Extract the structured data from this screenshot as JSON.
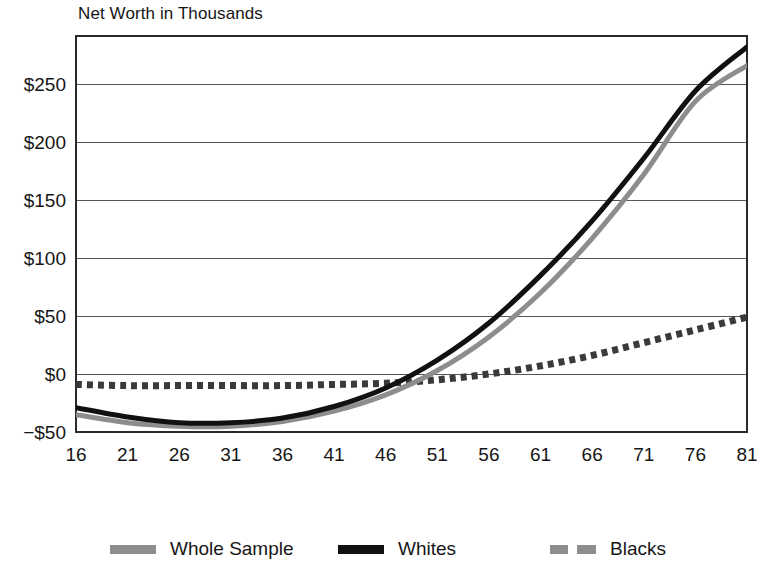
{
  "chart_data": {
    "type": "line",
    "title": "Net Worth in Thousands",
    "xlabel": "",
    "ylabel": "",
    "grid": true,
    "legend_position": "bottom",
    "xlim": [
      16,
      81
    ],
    "ylim": [
      -50,
      290
    ],
    "x_ticks": [
      16,
      21,
      26,
      31,
      36,
      41,
      46,
      51,
      56,
      61,
      66,
      71,
      76,
      81
    ],
    "x_tick_labels": [
      "16",
      "21",
      "26",
      "31",
      "36",
      "41",
      "46",
      "51",
      "56",
      "61",
      "66",
      "71",
      "76",
      "81"
    ],
    "y_ticks": [
      -50,
      0,
      50,
      100,
      150,
      200,
      250
    ],
    "y_tick_labels": [
      "−$50",
      "$0",
      "$50",
      "$100",
      "$150",
      "$200",
      "$250"
    ],
    "x": [
      16,
      21,
      26,
      31,
      36,
      41,
      46,
      51,
      56,
      61,
      66,
      71,
      76,
      81
    ],
    "series": [
      {
        "name": "Whole Sample",
        "style": "solid",
        "color": "#8d8d8d",
        "width": 5,
        "values": [
          -35,
          -42,
          -45,
          -45,
          -41,
          -32,
          -18,
          3,
          32,
          70,
          117,
          172,
          235,
          266
        ]
      },
      {
        "name": "Whites",
        "style": "solid",
        "color": "#111111",
        "width": 5,
        "values": [
          -29,
          -37,
          -42,
          -42,
          -38,
          -28,
          -12,
          12,
          44,
          85,
          132,
          186,
          244,
          282
        ]
      },
      {
        "name": "Blacks",
        "style": "dotted",
        "color": "#3a3a3a",
        "width": 7,
        "values": [
          -9,
          -10,
          -10,
          -10,
          -10,
          -9,
          -8,
          -5,
          0,
          7,
          16,
          27,
          38,
          49
        ]
      }
    ]
  },
  "legend": {
    "items": [
      {
        "label": "Whole Sample",
        "swatch": "solid-gray-swatch"
      },
      {
        "label": "Whites",
        "swatch": "solid-black-swatch"
      },
      {
        "label": "Blacks",
        "swatch": "dashed-gray-swatch"
      }
    ]
  },
  "axes": {
    "y_labels": [
      "$250",
      "$200",
      "$150",
      "$100",
      "$50",
      "$0",
      "−$50"
    ],
    "x_labels": [
      "16",
      "21",
      "26",
      "31",
      "36",
      "41",
      "46",
      "51",
      "56",
      "61",
      "66",
      "71",
      "76",
      "81"
    ]
  }
}
